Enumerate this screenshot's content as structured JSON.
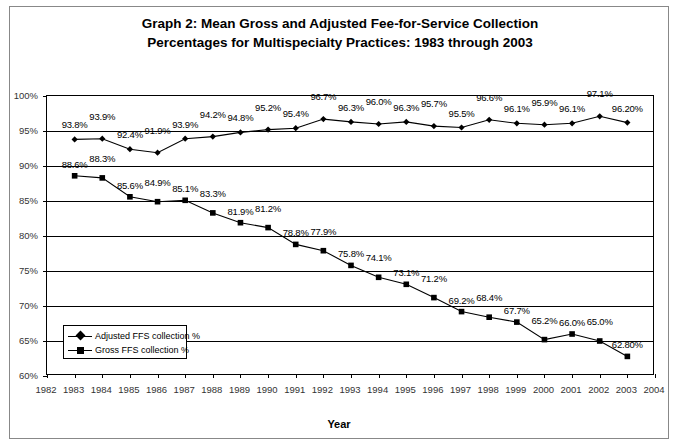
{
  "title": {
    "line1": "Graph 2: Mean Gross and Adjusted Fee-for-Service Collection",
    "line2": "Percentages for Multispecialty Practices: 1983 through 2003"
  },
  "axis": {
    "x_title": "Year"
  },
  "legend": {
    "items": [
      {
        "label": "Adjusted FFS collection %",
        "marker": "diamond-marker-icon"
      },
      {
        "label": "Gross FFS collection %",
        "marker": "square-marker-icon"
      }
    ]
  },
  "chart_data": {
    "type": "line",
    "title": "Graph 2: Mean Gross and Adjusted Fee-for-Service Collection Percentages for Multispecialty Practices: 1983 through 2003",
    "xlabel": "Year",
    "ylabel": "",
    "xlim": [
      1982,
      2004
    ],
    "ylim": [
      60,
      100
    ],
    "grid": true,
    "legend_position": "inside-bottom-left",
    "x": [
      1983,
      1984,
      1985,
      1986,
      1987,
      1988,
      1989,
      1990,
      1991,
      1992,
      1993,
      1994,
      1995,
      1996,
      1997,
      1998,
      1999,
      2000,
      2001,
      2002,
      2003
    ],
    "xtick_labels": [
      "1982",
      "1983",
      "1984",
      "1985",
      "1986",
      "1987",
      "1988",
      "1989",
      "1990",
      "1991",
      "1992",
      "1993",
      "1994",
      "1995",
      "1996",
      "1997",
      "1998",
      "1999",
      "2000",
      "2001",
      "2002",
      "2003",
      "2004"
    ],
    "ytick_labels": [
      "100%",
      "95%",
      "90%",
      "85%",
      "80%",
      "75%",
      "70%",
      "65%",
      "60%"
    ],
    "ytick_values": [
      100,
      95,
      90,
      85,
      80,
      75,
      70,
      65,
      60
    ],
    "series": [
      {
        "name": "Adjusted FFS collection %",
        "marker": "diamond",
        "values": [
          93.8,
          93.9,
          92.4,
          91.9,
          93.9,
          94.2,
          94.8,
          95.2,
          95.4,
          96.7,
          96.3,
          96.0,
          96.3,
          95.7,
          95.5,
          96.6,
          96.1,
          95.9,
          96.1,
          97.1,
          96.2
        ],
        "labels": [
          "93.8%",
          "93.9%",
          "92.4%",
          "91.9%",
          "93.9%",
          "94.2%",
          "94.8%",
          "95.2%",
          "95.4%",
          "96.7%",
          "96.3%",
          "96.0%",
          "96.3%",
          "95.7%",
          "95.5%",
          "96.6%",
          "96.1%",
          "95.9%",
          "96.1%",
          "97.1%",
          "96.20%"
        ]
      },
      {
        "name": "Gross FFS collection %",
        "marker": "square",
        "values": [
          88.6,
          88.3,
          85.6,
          84.9,
          85.1,
          83.3,
          81.9,
          81.2,
          78.8,
          77.9,
          75.8,
          74.1,
          73.1,
          71.2,
          69.2,
          68.4,
          67.7,
          65.2,
          66.0,
          65.0,
          62.8
        ],
        "labels": [
          "88.6%",
          "88.3%",
          "85.6%",
          "84.9%",
          "85.1%",
          "83.3%",
          "81.9%",
          "81.2%",
          "78.8%",
          "77.9%",
          "75.8%",
          "74.1%",
          "73.1%",
          "71.2%",
          "69.2%",
          "68.4%",
          "67.7%",
          "65.2%",
          "66.0%",
          "65.0%",
          "62.80%"
        ]
      }
    ]
  },
  "colors": {
    "line": "#000000",
    "grid": "#000000",
    "background": "#ffffff"
  }
}
